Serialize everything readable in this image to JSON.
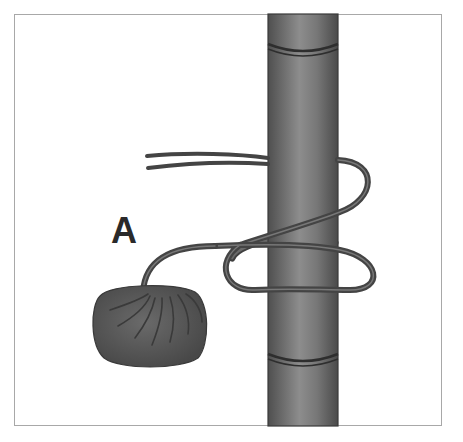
{
  "diagram": {
    "type": "knot-illustration",
    "labels": [
      {
        "id": "A",
        "text": "A",
        "points_to": "weight"
      }
    ],
    "elements": {
      "pole": {
        "description": "vertical bamboo pole with two node rings",
        "color": "#6a6a6a"
      },
      "cord": {
        "description": "doubled cord wrapped around pole forming loops",
        "color": "#4a4a4a"
      },
      "weight": {
        "description": "rounded weighted bundle at cord end",
        "color": "#5a5a5a"
      }
    }
  }
}
